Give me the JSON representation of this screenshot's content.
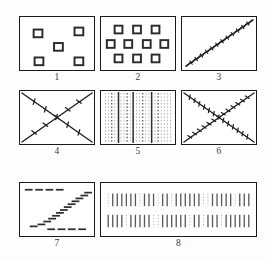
{
  "figure": {
    "background_color": "#fdfdfd",
    "ink_color": "#1a1a1a",
    "panel_count": 8,
    "layout": "3 columns x 3 rows, panel 8 spans two columns"
  },
  "panels": [
    {
      "id": "1",
      "label": "1",
      "pattern": "sparse-open-squares",
      "description": "Five small open squares in a quincunx arrangement",
      "element_count": 5,
      "element_shape": "square",
      "elements": [
        {
          "x": 14,
          "y": 13
        },
        {
          "x": 56,
          "y": 11
        },
        {
          "x": 35,
          "y": 27
        },
        {
          "x": 15,
          "y": 42
        },
        {
          "x": 56,
          "y": 42
        }
      ],
      "element_size": 9
    },
    {
      "id": "2",
      "label": "2",
      "pattern": "dense-open-squares",
      "description": "Ten small open squares in three rows of 3, 4 and 3",
      "element_count": 10,
      "element_shape": "square",
      "rows": [
        3,
        4,
        3
      ],
      "elements": [
        {
          "x": 14,
          "y": 9
        },
        {
          "x": 33,
          "y": 9
        },
        {
          "x": 52,
          "y": 9
        },
        {
          "x": 6,
          "y": 24
        },
        {
          "x": 24,
          "y": 24
        },
        {
          "x": 43,
          "y": 24
        },
        {
          "x": 61,
          "y": 24
        },
        {
          "x": 14,
          "y": 39
        },
        {
          "x": 33,
          "y": 39
        },
        {
          "x": 52,
          "y": 39
        }
      ],
      "element_size": 8
    },
    {
      "id": "3",
      "label": "3",
      "pattern": "single-jagged-diagonal",
      "description": "One jagged diagonal line running from bottom-left to top-right",
      "line_count": 1,
      "lines": [
        {
          "x1": 4,
          "y1": 50,
          "x2": 72,
          "y2": 4,
          "texture": "jagged"
        }
      ]
    },
    {
      "id": "4",
      "label": "4",
      "pattern": "crossed-diagonals-sparse-ticks",
      "description": "Two crossing diagonals forming an X, each carrying a few short oblique tick marks",
      "line_count": 2,
      "tick_density": "sparse",
      "ticks_per_line": 5,
      "lines": [
        {
          "x1": 3,
          "y1": 3,
          "x2": 72,
          "y2": 51
        },
        {
          "x1": 3,
          "y1": 51,
          "x2": 72,
          "y2": 3
        }
      ]
    },
    {
      "id": "5",
      "label": "5",
      "pattern": "vertical-dotted-columns",
      "description": "Many faint vertical dotted columns interrupted by three darker solid vertical lines",
      "dotted_column_count": 22,
      "solid_line_count": 3,
      "solid_line_positions": [
        18,
        33,
        52
      ]
    },
    {
      "id": "6",
      "label": "6",
      "pattern": "crossed-diagonals-dense-ticks",
      "description": "Two crossing diagonals forming an X, densely covered with short oblique tick marks",
      "line_count": 2,
      "tick_density": "dense",
      "ticks_per_line": 13,
      "lines": [
        {
          "x1": 3,
          "y1": 3,
          "x2": 72,
          "y2": 51
        },
        {
          "x1": 3,
          "y1": 51,
          "x2": 72,
          "y2": 3
        }
      ]
    },
    {
      "id": "7",
      "label": "7",
      "pattern": "dashed-sigmoid",
      "description": "Short horizontal dashes forming an S-shaped (sigmoid) staircase between a dashed line near the top and a dashed line near the bottom",
      "dash_count": 24,
      "dash_length": 8,
      "curve_shape": "sigmoid"
    },
    {
      "id": "8",
      "label": "8",
      "pattern": "two-rows-of-vertical-bars",
      "description": "Wide panel with two horizontal rows of short vertical bars of alternating darkness",
      "row_count": 2,
      "bars_per_row": 32,
      "bar_height": 13
    }
  ]
}
